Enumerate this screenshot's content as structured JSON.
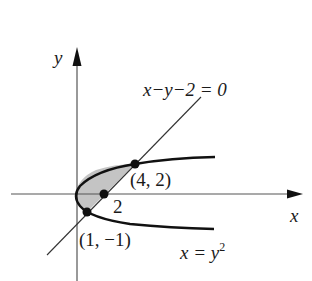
{
  "diagram": {
    "axes": {
      "x_label": "x",
      "y_label": "y"
    },
    "line_equation": "x−y−2 = 0",
    "curve_equation": "x = y",
    "curve_exponent": "2",
    "points": [
      {
        "label": "(4, 2)",
        "x": 4,
        "y": 2
      },
      {
        "label": "2",
        "x": 2,
        "y": 0
      },
      {
        "label": "(1, −1)",
        "x": 1,
        "y": -1
      }
    ],
    "colors": {
      "stroke": "#111111",
      "shaded_region": "#c4c4c4",
      "axis": "#555555"
    }
  }
}
